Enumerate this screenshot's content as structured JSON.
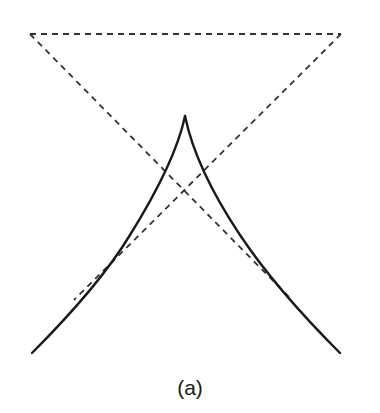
{
  "figure": {
    "caption": "(a)",
    "colors": {
      "stroke": "#1a1a1a",
      "dashed": "#333333",
      "background": "#ffffff"
    },
    "elements": {
      "dashed_triangle": {
        "style": "dashed",
        "top_left": [
          30,
          34
        ],
        "top_right": [
          341,
          34
        ],
        "left_diagonal_end": [
          290,
          298
        ],
        "right_diagonal_end": [
          75,
          298
        ]
      },
      "cusp_curve": {
        "style": "solid",
        "apex": [
          185,
          116
        ],
        "left_end": [
          32,
          353
        ],
        "right_end": [
          340,
          353
        ]
      }
    }
  }
}
